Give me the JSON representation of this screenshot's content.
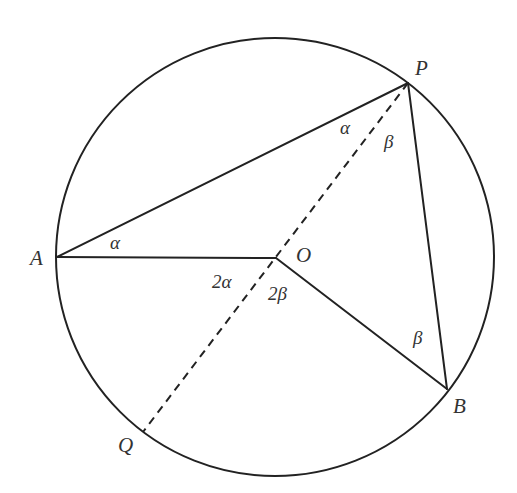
{
  "figure": {
    "circle": {
      "cx": 275,
      "cy": 257,
      "r": 219
    },
    "points": {
      "A": {
        "x": 57,
        "y": 257,
        "label": "A",
        "label_x": 30,
        "label_y": 265
      },
      "P": {
        "x": 408,
        "y": 83,
        "label": "P",
        "label_x": 415,
        "label_y": 75
      },
      "O": {
        "x": 276,
        "y": 258,
        "label": "O",
        "label_x": 296,
        "label_y": 262
      },
      "B": {
        "x": 447,
        "y": 389,
        "label": "B",
        "label_x": 453,
        "label_y": 413
      },
      "Q": {
        "x": 143,
        "y": 432,
        "label": "Q",
        "label_x": 118,
        "label_y": 452
      }
    },
    "segments": [
      {
        "from": "A",
        "to": "P",
        "style": "solid"
      },
      {
        "from": "A",
        "to": "O",
        "style": "solid"
      },
      {
        "from": "O",
        "to": "B",
        "style": "solid"
      },
      {
        "from": "P",
        "to": "B",
        "style": "solid"
      },
      {
        "from": "P",
        "to": "Q",
        "style": "dashed"
      }
    ],
    "angle_labels": [
      {
        "id": "angle-OAP",
        "text": "α",
        "x": 110,
        "y": 249
      },
      {
        "id": "angle-APO",
        "text": "α",
        "x": 340,
        "y": 134
      },
      {
        "id": "angle-OPB",
        "text": "β",
        "x": 384,
        "y": 148
      },
      {
        "id": "angle-AOQ",
        "text": "2α",
        "x": 212,
        "y": 288
      },
      {
        "id": "angle-QOB",
        "text": "2β",
        "x": 268,
        "y": 300
      },
      {
        "id": "angle-OBP",
        "text": "β",
        "x": 413,
        "y": 344
      }
    ],
    "colors": {
      "stroke": "#222222",
      "text": "#333333",
      "background": "#ffffff"
    }
  }
}
